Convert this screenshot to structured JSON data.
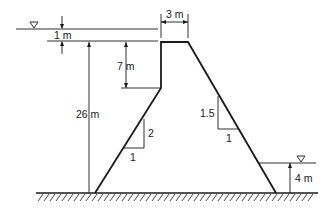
{
  "diagram": {
    "type": "dam cross-section",
    "labels": {
      "freeboard": "1 m",
      "crest_width": "3 m",
      "upper_vertical_face": "7 m",
      "upstream_water_depth": "26 m",
      "upstream_slope_rise": "2",
      "upstream_slope_run": "1",
      "downstream_slope_rise": "1.5",
      "downstream_slope_run": "1",
      "tailwater_depth": "4 m"
    },
    "symbols": {
      "upstream_water_surface": "water-surface-triangle",
      "downstream_water_surface": "water-surface-triangle",
      "ground": "hatched-ground"
    },
    "colors": {
      "line": "#1a1a1a",
      "background": "#ffffff"
    }
  }
}
